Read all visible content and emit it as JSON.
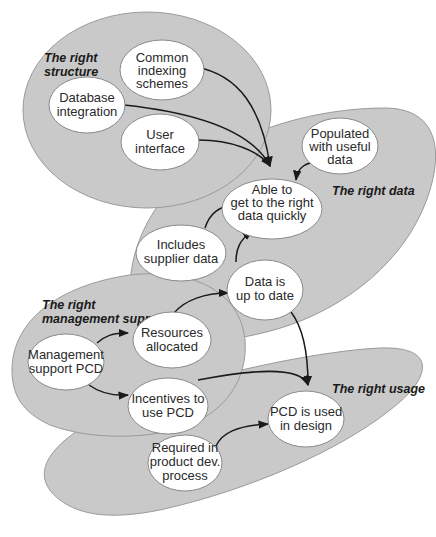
{
  "colors": {
    "group_fill": "#c9c9c9",
    "group_stroke": "#9a9a9a",
    "node_fill": "#ffffff",
    "edge": "#1a1a1a"
  },
  "groups": {
    "structure": {
      "label_line1": "The right",
      "label_line2": "structure"
    },
    "data": {
      "label": "The right data"
    },
    "management": {
      "label_line1": "The right",
      "label_line2": "management support"
    },
    "usage": {
      "label": "The right usage"
    }
  },
  "nodes": {
    "common_indexing": {
      "lines": [
        "Common",
        "indexing",
        "schemes"
      ]
    },
    "database_integration": {
      "lines": [
        "Database",
        "integration"
      ]
    },
    "user_interface": {
      "lines": [
        "User",
        "interface"
      ]
    },
    "populated": {
      "lines": [
        "Populated",
        "with useful",
        "data"
      ]
    },
    "able_to_get": {
      "lines": [
        "Able to",
        "get to the right",
        "data quickly"
      ]
    },
    "includes_supplier": {
      "lines": [
        "Includes",
        "supplier data"
      ]
    },
    "data_up_to_date": {
      "lines": [
        "Data is",
        "up to date"
      ]
    },
    "resources_allocated": {
      "lines": [
        "Resources",
        "allocated"
      ]
    },
    "management_support_pcd": {
      "lines": [
        "Management",
        "support PCD"
      ]
    },
    "incentives": {
      "lines": [
        "Incentives to",
        "use PCD"
      ]
    },
    "pcd_used": {
      "lines": [
        "PCD is used",
        "in design"
      ]
    },
    "required_in_process": {
      "lines": [
        "Required in",
        "product dev.",
        "process"
      ]
    }
  },
  "edges": [
    {
      "from": "common_indexing",
      "to": "able_to_get"
    },
    {
      "from": "database_integration",
      "to": "able_to_get"
    },
    {
      "from": "user_interface",
      "to": "able_to_get"
    },
    {
      "from": "populated",
      "to": "able_to_get"
    },
    {
      "from": "includes_supplier",
      "to": "able_to_get"
    },
    {
      "from": "data_up_to_date",
      "to": "able_to_get"
    },
    {
      "from": "resources_allocated",
      "to": "data_up_to_date"
    },
    {
      "from": "management_support_pcd",
      "to": "resources_allocated"
    },
    {
      "from": "management_support_pcd",
      "to": "incentives"
    },
    {
      "from": "incentives",
      "to": "pcd_used"
    },
    {
      "from": "data_up_to_date",
      "to": "pcd_used"
    },
    {
      "from": "required_in_process",
      "to": "pcd_used"
    }
  ]
}
